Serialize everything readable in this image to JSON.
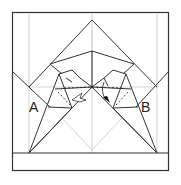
{
  "diagram": {
    "type": "origami-fold-diagram",
    "labels": [
      {
        "id": "A",
        "text": "A"
      },
      {
        "id": "B",
        "text": "B"
      }
    ],
    "colors": {
      "line": "#333333",
      "crease": "#bbbbbb",
      "background": "#ffffff",
      "arrow_fill": "#000000"
    },
    "annotations": {
      "left_arrow": "hollow push arrow (fold in)",
      "right_arrow": "solid arrowhead (fold down)",
      "dashed_lines": "valley fold lines"
    }
  }
}
